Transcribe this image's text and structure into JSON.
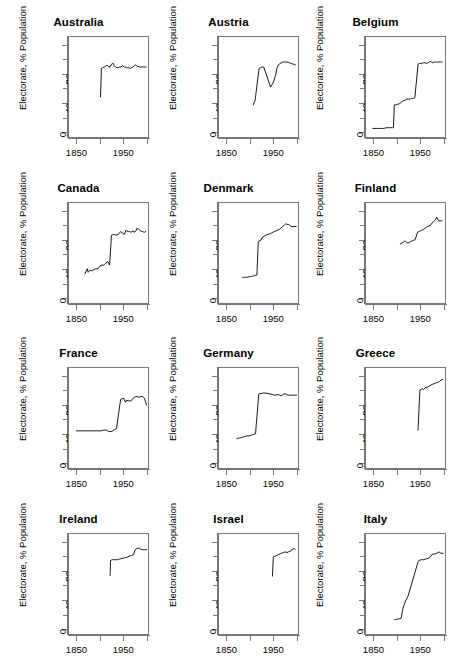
{
  "figure": {
    "ylabel": "Electorate, % Population",
    "grid": {
      "rows": 4,
      "cols": 3
    }
  },
  "chart_data": [
    {
      "type": "line",
      "title": "Australia",
      "xlabel": "",
      "ylabel": "Electorate, % Population",
      "xlim": [
        1832,
        2005
      ],
      "ylim": [
        -8,
        132
      ],
      "xticks": [
        1850,
        1900,
        1950,
        2000
      ],
      "xticklabels": [
        "1850",
        "",
        "1950",
        ""
      ],
      "yticks": [
        0,
        20,
        40,
        60,
        80,
        100,
        120
      ],
      "yticklabels": [
        "0",
        "",
        "40",
        "",
        "80",
        "",
        "120"
      ],
      "grid": false,
      "legend": "none",
      "x": [
        1901,
        1903,
        1906,
        1910,
        1913,
        1914,
        1917,
        1919,
        1922,
        1925,
        1928,
        1929,
        1931,
        1934,
        1937,
        1940,
        1943,
        1946,
        1949,
        1951,
        1954,
        1955,
        1958,
        1961,
        1963,
        1966,
        1969,
        1972,
        1974,
        1975,
        1977,
        1980,
        1983,
        1984,
        1987,
        1990,
        1993,
        1996,
        1998,
        2001
      ],
      "y": [
        48,
        88,
        89,
        90,
        92,
        92,
        92,
        90,
        90,
        94,
        95,
        95,
        92,
        90,
        89,
        89,
        90,
        90,
        92,
        91,
        90,
        90,
        89,
        89,
        89,
        88,
        89,
        90,
        91,
        92,
        93,
        92,
        90,
        91,
        90,
        90,
        90,
        90,
        90,
        90
      ]
    },
    {
      "type": "line",
      "title": "Austria",
      "xlabel": "",
      "ylabel": "Electorate, % Population",
      "xlim": [
        1832,
        2005
      ],
      "ylim": [
        -8,
        132
      ],
      "xticks": [
        1850,
        1900,
        1950,
        2000
      ],
      "xticklabels": [
        "1850",
        "",
        "1950",
        ""
      ],
      "yticks": [
        0,
        20,
        40,
        60,
        80,
        100,
        120
      ],
      "yticklabels": [
        "0",
        "",
        "40",
        "",
        "80",
        "",
        "120"
      ],
      "grid": false,
      "legend": "none",
      "x": [
        1907,
        1911,
        1919,
        1920,
        1923,
        1927,
        1930,
        1945,
        1949,
        1953,
        1956,
        1959,
        1962,
        1966,
        1970,
        1971,
        1975,
        1979,
        1983,
        1986,
        1990,
        1994,
        1995,
        1999
      ],
      "y": [
        37,
        43,
        84,
        88,
        89,
        90,
        90,
        62,
        66,
        72,
        79,
        88,
        93,
        95,
        96,
        97,
        97,
        97,
        97,
        96,
        95,
        94,
        94,
        93
      ]
    },
    {
      "type": "line",
      "title": "Belgium",
      "xlabel": "",
      "ylabel": "Electorate, % Population",
      "xlim": [
        1832,
        2005
      ],
      "ylim": [
        -8,
        132
      ],
      "xticks": [
        1850,
        1900,
        1950,
        2000
      ],
      "xticklabels": [
        "1850",
        "",
        "1950",
        ""
      ],
      "yticks": [
        0,
        20,
        40,
        60,
        80,
        100,
        120
      ],
      "yticklabels": [
        "0",
        "",
        "40",
        "",
        "80",
        "",
        "120"
      ],
      "grid": false,
      "legend": "none",
      "x": [
        1847,
        1857,
        1864,
        1870,
        1878,
        1884,
        1890,
        1892,
        1894,
        1898,
        1900,
        1904,
        1908,
        1912,
        1919,
        1921,
        1925,
        1929,
        1932,
        1936,
        1939,
        1946,
        1949,
        1950,
        1954,
        1958,
        1961,
        1965,
        1968,
        1971,
        1974,
        1977,
        1978,
        1981,
        1985,
        1987,
        1991,
        1995,
        1999
      ],
      "y": [
        4,
        4,
        4,
        4,
        5,
        5,
        5,
        5,
        37,
        37,
        38,
        38,
        40,
        42,
        44,
        45,
        45,
        45,
        46,
        46,
        47,
        94,
        95,
        95,
        95,
        96,
        96,
        95,
        96,
        97,
        98,
        96,
        96,
        97,
        97,
        97,
        97,
        97,
        97
      ]
    },
    {
      "type": "line",
      "title": "Canada",
      "xlabel": "",
      "ylabel": "Electorate, % Population",
      "xlim": [
        1832,
        2005
      ],
      "ylim": [
        -8,
        132
      ],
      "xticks": [
        1850,
        1900,
        1950,
        2000
      ],
      "xticklabels": [
        "1850",
        "",
        "1950",
        ""
      ],
      "yticks": [
        0,
        20,
        40,
        60,
        80,
        100,
        120
      ],
      "yticklabels": [
        "0",
        "",
        "40",
        "",
        "80",
        "",
        "120"
      ],
      "grid": false,
      "legend": "none",
      "x": [
        1867,
        1872,
        1874,
        1878,
        1882,
        1887,
        1891,
        1896,
        1900,
        1904,
        1908,
        1911,
        1917,
        1921,
        1925,
        1926,
        1930,
        1935,
        1940,
        1945,
        1949,
        1953,
        1957,
        1958,
        1962,
        1963,
        1965,
        1968,
        1972,
        1974,
        1979,
        1980,
        1984,
        1988,
        1993,
        1997,
        2000
      ],
      "y": [
        33,
        40,
        35,
        38,
        37,
        39,
        40,
        40,
        44,
        45,
        45,
        47,
        50,
        45,
        87,
        87,
        88,
        87,
        88,
        92,
        90,
        88,
        94,
        93,
        92,
        92,
        92,
        91,
        93,
        91,
        93,
        96,
        96,
        93,
        92,
        91,
        92
      ]
    },
    {
      "type": "line",
      "title": "Denmark",
      "xlabel": "",
      "ylabel": "Electorate, % Population",
      "xlim": [
        1832,
        2005
      ],
      "ylim": [
        -8,
        132
      ],
      "xticks": [
        1850,
        1900,
        1950,
        2000
      ],
      "xticklabels": [
        "1850",
        "",
        "1950",
        ""
      ],
      "yticks": [
        0,
        20,
        40,
        60,
        80,
        100,
        120
      ],
      "yticklabels": [
        "0",
        "",
        "40",
        "",
        "80",
        "",
        "120"
      ],
      "grid": false,
      "legend": "none",
      "x": [
        1884,
        1887,
        1890,
        1892,
        1895,
        1898,
        1901,
        1903,
        1906,
        1909,
        1910,
        1913,
        1915,
        1918,
        1920,
        1924,
        1926,
        1929,
        1932,
        1935,
        1939,
        1943,
        1945,
        1947,
        1950,
        1953,
        1957,
        1960,
        1964,
        1966,
        1968,
        1971,
        1973,
        1975,
        1977,
        1979,
        1981,
        1984,
        1987,
        1988,
        1990,
        1994,
        1998,
        2001
      ],
      "y": [
        28,
        28,
        28,
        28,
        28,
        29,
        29,
        29,
        30,
        30,
        30,
        31,
        31,
        78,
        79,
        80,
        83,
        85,
        86,
        87,
        88,
        89,
        89,
        90,
        91,
        92,
        93,
        94,
        95,
        96,
        97,
        99,
        100,
        101,
        102,
        103,
        102,
        102,
        101,
        100,
        99,
        99,
        99,
        99
      ]
    },
    {
      "type": "line",
      "title": "Finland",
      "xlabel": "",
      "ylabel": "Electorate, % Population",
      "xlim": [
        1832,
        2005
      ],
      "ylim": [
        -8,
        132
      ],
      "xticks": [
        1850,
        1900,
        1950,
        2000
      ],
      "xticklabels": [
        "1850",
        "",
        "1950",
        ""
      ],
      "yticks": [
        0,
        20,
        40,
        60,
        80,
        100,
        120
      ],
      "yticklabels": [
        "0",
        "",
        "40",
        "",
        "80",
        "",
        "120"
      ],
      "grid": false,
      "legend": "none",
      "x": [
        1907,
        1908,
        1909,
        1910,
        1911,
        1913,
        1916,
        1917,
        1919,
        1922,
        1924,
        1927,
        1929,
        1930,
        1933,
        1936,
        1939,
        1945,
        1948,
        1951,
        1954,
        1958,
        1962,
        1966,
        1970,
        1972,
        1975,
        1979,
        1983,
        1987,
        1991,
        1995,
        1999
      ],
      "y": [
        75,
        75,
        75,
        76,
        76,
        77,
        78,
        79,
        78,
        76,
        76,
        77,
        78,
        78,
        79,
        80,
        80,
        91,
        92,
        93,
        94,
        95,
        97,
        99,
        100,
        100,
        103,
        105,
        108,
        112,
        107,
        107,
        107
      ]
    },
    {
      "type": "line",
      "title": "France",
      "xlabel": "",
      "ylabel": "Electorate, % Population",
      "xlim": [
        1832,
        2005
      ],
      "ylim": [
        -8,
        132
      ],
      "xticks": [
        1850,
        1900,
        1950,
        2000
      ],
      "xticklabels": [
        "1850",
        "",
        "1950",
        ""
      ],
      "yticks": [
        0,
        20,
        40,
        60,
        80,
        100,
        120
      ],
      "yticklabels": [
        "0",
        "",
        "40",
        "",
        "80",
        "",
        "120"
      ],
      "grid": false,
      "legend": "none",
      "x": [
        1848,
        1852,
        1857,
        1863,
        1869,
        1871,
        1876,
        1877,
        1881,
        1885,
        1889,
        1893,
        1898,
        1902,
        1906,
        1910,
        1914,
        1919,
        1924,
        1928,
        1932,
        1936,
        1945,
        1946,
        1951,
        1956,
        1958,
        1962,
        1967,
        1968,
        1973,
        1978,
        1981,
        1986,
        1988,
        1993,
        1997,
        2002
      ],
      "y": [
        44,
        44,
        44,
        44,
        44,
        44,
        44,
        44,
        44,
        44,
        44,
        44,
        44,
        44,
        45,
        45,
        45,
        43,
        43,
        44,
        46,
        47,
        88,
        88,
        90,
        84,
        87,
        86,
        86,
        86,
        90,
        92,
        92,
        91,
        92,
        92,
        90,
        80
      ]
    },
    {
      "type": "line",
      "title": "Germany",
      "xlabel": "",
      "ylabel": "Electorate, % Population",
      "xlim": [
        1832,
        2005
      ],
      "ylim": [
        -8,
        132
      ],
      "xticks": [
        1850,
        1900,
        1950,
        2000
      ],
      "xticklabels": [
        "1850",
        "",
        "1950",
        ""
      ],
      "yticks": [
        0,
        20,
        40,
        60,
        80,
        100,
        120
      ],
      "yticklabels": [
        "0",
        "",
        "40",
        "",
        "80",
        "",
        "120"
      ],
      "grid": false,
      "legend": "none",
      "x": [
        1871,
        1874,
        1877,
        1878,
        1881,
        1884,
        1887,
        1890,
        1893,
        1898,
        1903,
        1907,
        1912,
        1919,
        1920,
        1924,
        1928,
        1930,
        1932,
        1933,
        1949,
        1953,
        1957,
        1961,
        1965,
        1969,
        1972,
        1976,
        1980,
        1983,
        1987,
        1990,
        1994,
        1998,
        2002
      ],
      "y": [
        33,
        34,
        34,
        34,
        35,
        35,
        36,
        36,
        37,
        37,
        38,
        39,
        40,
        95,
        96,
        96,
        97,
        97,
        97,
        97,
        95,
        94,
        94,
        95,
        94,
        93,
        95,
        96,
        95,
        94,
        94,
        94,
        94,
        94,
        94
      ]
    },
    {
      "type": "line",
      "title": "Greece",
      "xlabel": "",
      "ylabel": "Electorate, % Population",
      "xlim": [
        1832,
        2005
      ],
      "ylim": [
        -8,
        132
      ],
      "xticks": [
        1850,
        1900,
        1950,
        2000
      ],
      "xticklabels": [
        "1850",
        "",
        "1950",
        ""
      ],
      "yticks": [
        0,
        20,
        40,
        60,
        80,
        100,
        120
      ],
      "yticklabels": [
        "0",
        "",
        "40",
        "",
        "80",
        "",
        "120"
      ],
      "grid": false,
      "legend": "none",
      "x": [
        1946,
        1950,
        1951,
        1952,
        1956,
        1958,
        1961,
        1963,
        1964,
        1974,
        1977,
        1981,
        1985,
        1989,
        1990,
        1993,
        1996,
        2000
      ],
      "y": [
        45,
        101,
        101,
        102,
        103,
        102,
        104,
        105,
        104,
        108,
        109,
        110,
        111,
        112,
        112,
        113,
        115,
        116
      ]
    },
    {
      "type": "line",
      "title": "Ireland",
      "xlabel": "",
      "ylabel": "Electorate, % Population",
      "xlim": [
        1832,
        2005
      ],
      "ylim": [
        -8,
        132
      ],
      "xticks": [
        1850,
        1900,
        1950,
        2000
      ],
      "xticklabels": [
        "1850",
        "",
        "1950",
        ""
      ],
      "yticks": [
        0,
        20,
        40,
        60,
        80,
        100,
        120
      ],
      "yticklabels": [
        "0",
        "",
        "40",
        "",
        "80",
        "",
        "120"
      ],
      "grid": false,
      "legend": "none",
      "x": [
        1922,
        1923,
        1927,
        1932,
        1933,
        1937,
        1938,
        1943,
        1944,
        1948,
        1951,
        1954,
        1957,
        1961,
        1965,
        1969,
        1973,
        1977,
        1981,
        1982,
        1987,
        1989,
        1992,
        1997,
        2002
      ],
      "y": [
        74,
        95,
        96,
        96,
        96,
        96,
        96,
        97,
        97,
        98,
        98,
        99,
        99,
        100,
        101,
        102,
        103,
        110,
        112,
        112,
        112,
        111,
        110,
        110,
        110
      ]
    },
    {
      "type": "line",
      "title": "Israel",
      "xlabel": "",
      "ylabel": "Electorate, % Population",
      "xlim": [
        1832,
        2005
      ],
      "ylim": [
        -8,
        132
      ],
      "xticks": [
        1850,
        1900,
        1950,
        2000
      ],
      "xticklabels": [
        "1850",
        "",
        "1950",
        ""
      ],
      "yticks": [
        0,
        20,
        40,
        60,
        80,
        100,
        120
      ],
      "yticklabels": [
        "0",
        "",
        "40",
        "",
        "80",
        "",
        "120"
      ],
      "grid": false,
      "legend": "none",
      "x": [
        1949,
        1951,
        1955,
        1959,
        1961,
        1965,
        1969,
        1973,
        1977,
        1981,
        1984,
        1988,
        1992,
        1996,
        1999
      ],
      "y": [
        73,
        100,
        101,
        102,
        103,
        104,
        105,
        106,
        107,
        106,
        107,
        108,
        110,
        112,
        110
      ]
    },
    {
      "type": "line",
      "title": "Italy",
      "xlabel": "",
      "ylabel": "Electorate, % Population",
      "xlim": [
        1832,
        2005
      ],
      "ylim": [
        -8,
        132
      ],
      "xticks": [
        1850,
        1900,
        1950,
        2000
      ],
      "xticklabels": [
        "1850",
        "",
        "1950",
        ""
      ],
      "yticks": [
        0,
        20,
        40,
        60,
        80,
        100,
        120
      ],
      "yticklabels": [
        "0",
        "",
        "40",
        "",
        "80",
        "",
        "120"
      ],
      "grid": false,
      "legend": "none",
      "x": [
        1895,
        1897,
        1900,
        1904,
        1909,
        1913,
        1919,
        1921,
        1924,
        1946,
        1948,
        1953,
        1958,
        1963,
        1968,
        1972,
        1976,
        1979,
        1983,
        1987,
        1992,
        1994,
        1996,
        2001
      ],
      "y": [
        12,
        12,
        13,
        13,
        14,
        28,
        39,
        41,
        45,
        93,
        95,
        96,
        96,
        97,
        98,
        99,
        103,
        104,
        104,
        105,
        107,
        106,
        105,
        105
      ]
    }
  ],
  "panel_layout": [
    {
      "left": 3,
      "top": 14
    },
    {
      "left": 153,
      "top": 14
    },
    {
      "left": 300,
      "top": 14
    },
    {
      "left": 3,
      "top": 180
    },
    {
      "left": 153,
      "top": 180
    },
    {
      "left": 300,
      "top": 180
    },
    {
      "left": 3,
      "top": 345
    },
    {
      "left": 153,
      "top": 345
    },
    {
      "left": 300,
      "top": 345
    },
    {
      "left": 3,
      "top": 511
    },
    {
      "left": 153,
      "top": 511
    },
    {
      "left": 300,
      "top": 511
    }
  ]
}
